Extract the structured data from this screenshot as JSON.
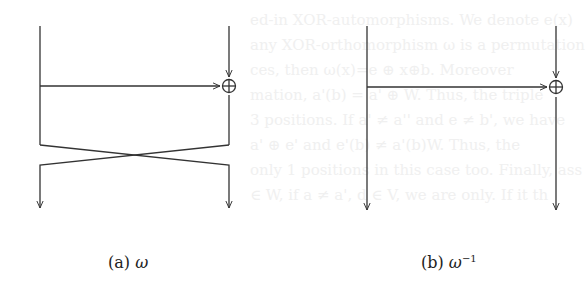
{
  "background_text_lines": [
    "ed-in XOR-automorphisms. We denote e(x)",
    "any XOR-orthomorphism ω is a permutation",
    "ces, then ω(x)=e ⊕ x⊕b. Moreover",
    "mation, a'(b) = a' ⊕ W. Thus, the triple",
    "3 positions. If a' ≠ a'' and e ≠ b', we have",
    "a' ⊕ e' and e'(b) ≠ a'(b)W. Thus, the",
    "only 1 positions in this case too. Finally, ass",
    "∈ W, if a ≠ a', d ∈ V, we are only. If it th"
  ],
  "figures": [
    {
      "id": "a",
      "caption_label": "(a)",
      "caption_symbol": "ω",
      "caption_superscript": "",
      "xor_symbol": "⊕"
    },
    {
      "id": "b",
      "caption_label": "(b)",
      "caption_symbol": "ω",
      "caption_superscript": "−1",
      "xor_symbol": "⊕"
    }
  ],
  "colors": {
    "line": "#333333",
    "text": "#222222",
    "background": "#ffffff"
  }
}
